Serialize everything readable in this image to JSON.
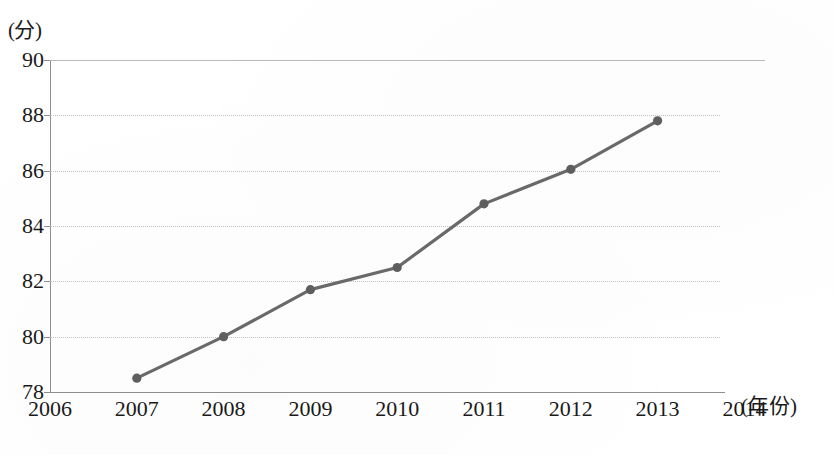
{
  "chart_data": {
    "type": "line",
    "title": "",
    "xlabel": "(年份)",
    "ylabel": "(分)",
    "x": [
      2006,
      2007,
      2008,
      2009,
      2010,
      2011,
      2012,
      2013,
      2014
    ],
    "categories": [
      "2006",
      "2007",
      "2008",
      "2009",
      "2010",
      "2011",
      "2012",
      "2013",
      "2014"
    ],
    "series": [
      {
        "name": "",
        "x": [
          2007,
          2008,
          2009,
          2010,
          2011,
          2012,
          2013
        ],
        "values": [
          78.5,
          80.0,
          81.7,
          82.5,
          84.8,
          86.05,
          87.8
        ]
      }
    ],
    "ylim": [
      78,
      90
    ],
    "xlim": [
      2006,
      2014
    ],
    "yticks": [
      "90",
      "88",
      "86",
      "84",
      "82",
      "80",
      "78"
    ],
    "ytick_values": [
      90,
      88,
      86,
      84,
      82,
      80,
      78
    ],
    "xticks": [
      "2006",
      "2007",
      "2008",
      "2009",
      "2010",
      "2011",
      "2012",
      "2013",
      "2014"
    ],
    "grid": true,
    "grid_axis": "y",
    "grid_style": "dotted",
    "legend": false,
    "legend_position": "none",
    "marker": "circle",
    "line_color": "#6a6a6a",
    "marker_color": "#5f5f5f",
    "grid_color": "#c2c2c2",
    "axis_color": "#8d8d8d",
    "background_color": "#ffffff",
    "text_color": "#1a1a1a"
  }
}
